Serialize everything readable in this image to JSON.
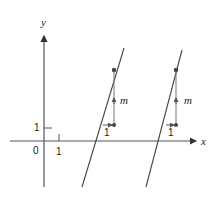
{
  "diagram": {
    "type": "coordinate-plane",
    "axes": {
      "x_label": "x",
      "y_label": "y",
      "origin_label": "0",
      "x_tick_label": "1",
      "y_tick_label": "1"
    },
    "lines": [
      {
        "name": "line-1",
        "run_label": "1",
        "rise_label": "m"
      },
      {
        "name": "line-2",
        "run_label": "1",
        "rise_label": "m"
      }
    ],
    "colors": {
      "axis": "#333333",
      "line": "#444444",
      "accent": "#555555"
    }
  }
}
